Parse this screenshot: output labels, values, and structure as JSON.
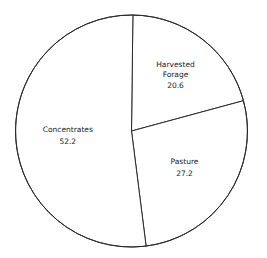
{
  "chart_data": {
    "type": "pie",
    "title": "",
    "slices": [
      {
        "label": "Harvested Forage",
        "label_lines": [
          "Harvested",
          "Forage"
        ],
        "value": 20.6,
        "value_text": "20.6"
      },
      {
        "label": "Pasture",
        "label_lines": [
          "Pasture"
        ],
        "value": 27.2,
        "value_text": "27.2"
      },
      {
        "label": "Concentrates",
        "label_lines": [
          "Concentrates"
        ],
        "value": 52.2,
        "value_text": "52.2"
      }
    ],
    "start_direction": "top",
    "direction": "clockwise",
    "colors": {
      "fill": "#ffffff",
      "stroke": "#2a2a2a",
      "text": "#1a1a1a"
    },
    "legend": "none"
  }
}
